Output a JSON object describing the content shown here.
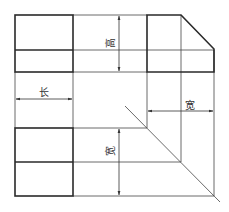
{
  "diagram": {
    "type": "three-view orthographic projection",
    "views": [
      {
        "name": "front-view",
        "position": "top-left"
      },
      {
        "name": "side-view",
        "position": "top-right",
        "feature": "chamfered top-right corner"
      },
      {
        "name": "top-view",
        "position": "bottom-left"
      }
    ],
    "labels": {
      "height": "高",
      "length": "长",
      "width_side": "宽",
      "width_top": "宽"
    },
    "colors": {
      "line": "#2a2a2a",
      "background": "#ffffff"
    }
  }
}
